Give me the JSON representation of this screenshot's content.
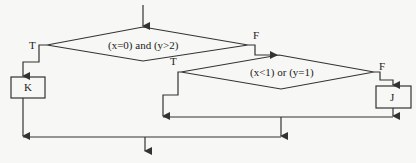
{
  "diagram": {
    "type": "flowchart",
    "colors": {
      "line": "#333333",
      "background": "#f7f7f5",
      "text": "#222222"
    },
    "decision1": {
      "condition": "(x=0) and (y>2)",
      "true_label": "T",
      "false_label": "F"
    },
    "decision2": {
      "condition": "(x<1) or (y=1)",
      "true_label": "T",
      "false_label": "F"
    },
    "process_k": {
      "label": "K"
    },
    "process_j": {
      "label": "J"
    }
  }
}
